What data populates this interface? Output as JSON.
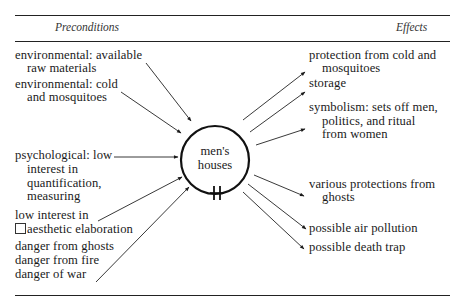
{
  "header": {
    "left": "Preconditions",
    "right": "Effects"
  },
  "center": {
    "line1": "men's",
    "line2": "houses"
  },
  "preconditions": [
    {
      "lines": [
        "environmental: available",
        "raw materials"
      ]
    },
    {
      "lines": [
        "environmental: cold",
        "and mosquitoes"
      ]
    },
    {
      "lines": [
        "psychological: low",
        "interest in",
        "quantification,",
        "measuring"
      ]
    },
    {
      "lines": [
        "low interest in",
        "aesthetic elaboration"
      ]
    },
    {
      "lines": [
        "danger from ghosts"
      ]
    },
    {
      "lines": [
        "danger from fire"
      ]
    },
    {
      "lines": [
        "danger of war"
      ]
    }
  ],
  "effects": [
    {
      "lines": [
        "protection from cold and",
        "mosquitoes"
      ]
    },
    {
      "lines": [
        "storage"
      ]
    },
    {
      "lines": [
        "symbolism: sets off men,",
        "politics, and ritual",
        "from women"
      ]
    },
    {
      "lines": [
        "various protections from",
        "ghosts"
      ]
    },
    {
      "lines": [
        "possible air pollution"
      ]
    },
    {
      "lines": [
        "possible death trap"
      ]
    }
  ],
  "colors": {
    "ink": "#1a1a1a",
    "background": "#ffffff"
  }
}
